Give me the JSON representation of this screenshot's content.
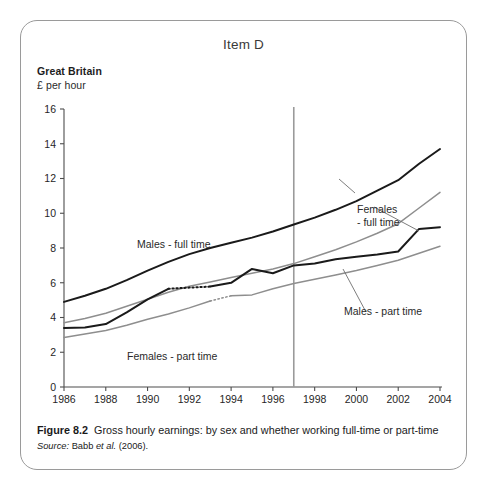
{
  "figure": {
    "item_title": "Item D",
    "region_label": "Great Britain",
    "unit_label": "£ per hour",
    "caption_label": "Figure 8.2",
    "caption_text": "Gross hourly earnings: by sex and whether working full-time or part-time",
    "source_label": "Source:",
    "source_author": "Babb",
    "source_etal": "et al.",
    "source_year": "(2006)."
  },
  "colors": {
    "dark_series": "#1a1a1a",
    "light_series": "#8e8e8e",
    "reference_line": "#9a9a9a",
    "axis": "#4d4d4d",
    "border": "#9a9a9a",
    "background": "#ffffff"
  },
  "annotations": {
    "males_full_time": "Males - full time",
    "females_full_time_line1": "Females",
    "females_full_time_line2": "- full time",
    "males_part_time": "Males - part time",
    "females_part_time": "Females - part time"
  },
  "chart_data": {
    "type": "line",
    "title": "Item D",
    "subtitle": "Great Britain",
    "xlabel": "",
    "ylabel": "£ per hour",
    "xlim": [
      1986,
      2004
    ],
    "ylim": [
      0,
      16
    ],
    "ytick_step": 2,
    "xtick_step": 2,
    "grid": false,
    "legend": "inline-annotations",
    "x": [
      1986,
      1987,
      1988,
      1989,
      1990,
      1991,
      1992,
      1993,
      1994,
      1995,
      1996,
      1997,
      1998,
      1999,
      2000,
      2001,
      2002,
      2003,
      2004
    ],
    "xticks": [
      "1986",
      "1988",
      "1990",
      "1992",
      "1994",
      "1996",
      "1998",
      "2000",
      "2002",
      "2004"
    ],
    "yticks": [
      "0",
      "2",
      "4",
      "6",
      "8",
      "10",
      "12",
      "14",
      "16"
    ],
    "reference_line_x": 1997,
    "series": [
      {
        "name": "Males - full time",
        "style": "solid",
        "color": "#1a1a1a",
        "values": [
          4.9,
          5.25,
          5.65,
          6.15,
          6.7,
          7.2,
          7.65,
          8.0,
          8.3,
          8.6,
          8.95,
          9.35,
          9.75,
          10.2,
          10.7,
          11.3,
          11.9,
          12.85,
          13.7
        ],
        "break_at": 1997,
        "values_post_break": [
          10.1,
          10.55,
          11.05,
          11.55,
          12.2,
          12.8,
          12.95,
          13.7
        ]
      },
      {
        "name": "Females - full time",
        "style": "solid",
        "color": "#8e8e8e",
        "values": [
          3.7,
          3.95,
          4.25,
          4.65,
          5.05,
          5.45,
          5.8,
          6.05,
          6.3,
          6.55,
          6.8,
          7.1,
          7.5,
          7.9,
          8.35,
          8.85,
          9.4,
          10.3,
          11.2
        ],
        "break_at": 1997,
        "values_post_break": [
          8.05,
          8.45,
          8.9,
          9.35,
          9.85,
          10.3,
          10.75,
          11.2
        ]
      },
      {
        "name": "Males - part time",
        "style": "solid-with-dotted-gap",
        "color": "#1a1a1a",
        "dotted_segment_years": [
          1991,
          1993
        ],
        "values": [
          3.4,
          3.42,
          3.62,
          4.3,
          5.05,
          5.65,
          5.72,
          5.78,
          6.0,
          6.8,
          6.55,
          7.0,
          7.1,
          7.35,
          7.5,
          7.62,
          7.8,
          9.1,
          9.2
        ],
        "break_at": 1997
      },
      {
        "name": "Females - part time",
        "style": "solid-with-dotted-gap",
        "color": "#8e8e8e",
        "dotted_segment_years": [
          1993,
          1994
        ],
        "values": [
          2.85,
          3.05,
          3.25,
          3.55,
          3.9,
          4.2,
          4.55,
          4.95,
          5.25,
          5.3,
          5.65,
          5.95,
          6.2,
          6.45,
          6.7,
          7.0,
          7.3,
          7.7,
          8.1
        ],
        "break_at": 1997
      }
    ]
  }
}
